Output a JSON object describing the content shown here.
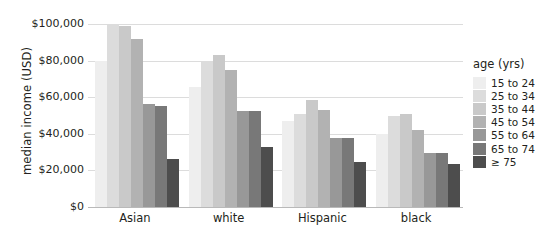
{
  "chart_data": {
    "type": "bar",
    "title": "",
    "xlabel": "",
    "ylabel": "median income (USD)",
    "categories": [
      "Asian",
      "white",
      "Hispanic",
      "black"
    ],
    "legend_title": "age (yrs)",
    "legend_position": "right",
    "grid": true,
    "ylim": [
      0,
      100000
    ],
    "yticks": [
      0,
      20000,
      40000,
      60000,
      80000,
      100000
    ],
    "ytick_labels": [
      "$0",
      "$20,000",
      "$40,000",
      "$60,000",
      "$80,000",
      "$100,000"
    ],
    "series": [
      {
        "name": "15 to 24",
        "color": "#eeeeee",
        "values": [
          80000,
          65500,
          47000,
          40000
        ]
      },
      {
        "name": "25 to 34",
        "color": "#dcdcdc",
        "values": [
          100000,
          79000,
          51000,
          50000
        ]
      },
      {
        "name": "35 to 44",
        "color": "#c9c9c9",
        "values": [
          99000,
          83000,
          58500,
          51000
        ]
      },
      {
        "name": "45 to 54",
        "color": "#b2b2b2",
        "values": [
          92000,
          75000,
          53000,
          42000
        ]
      },
      {
        "name": "55 to 64",
        "color": "#989898",
        "values": [
          56500,
          52500,
          37500,
          29500
        ]
      },
      {
        "name": "65 to 74",
        "color": "#787878",
        "values": [
          55000,
          52500,
          37500,
          29500
        ]
      },
      {
        "name": "≥ 75",
        "color": "#4d4d4d",
        "values": [
          26500,
          33000,
          24500,
          23500
        ]
      }
    ]
  },
  "axis": {
    "ylabel": "median income (USD)"
  },
  "legend": {
    "title": "age (yrs)",
    "items": [
      {
        "label": "15 to 24",
        "color": "#eeeeee"
      },
      {
        "label": "25 to 34",
        "color": "#dcdcdc"
      },
      {
        "label": "35 to 44",
        "color": "#c9c9c9"
      },
      {
        "label": "45 to 54",
        "color": "#b2b2b2"
      },
      {
        "label": "55 to 64",
        "color": "#989898"
      },
      {
        "label": "65 to 74",
        "color": "#787878"
      },
      {
        "label": "≥ 75",
        "color": "#4d4d4d"
      }
    ]
  }
}
